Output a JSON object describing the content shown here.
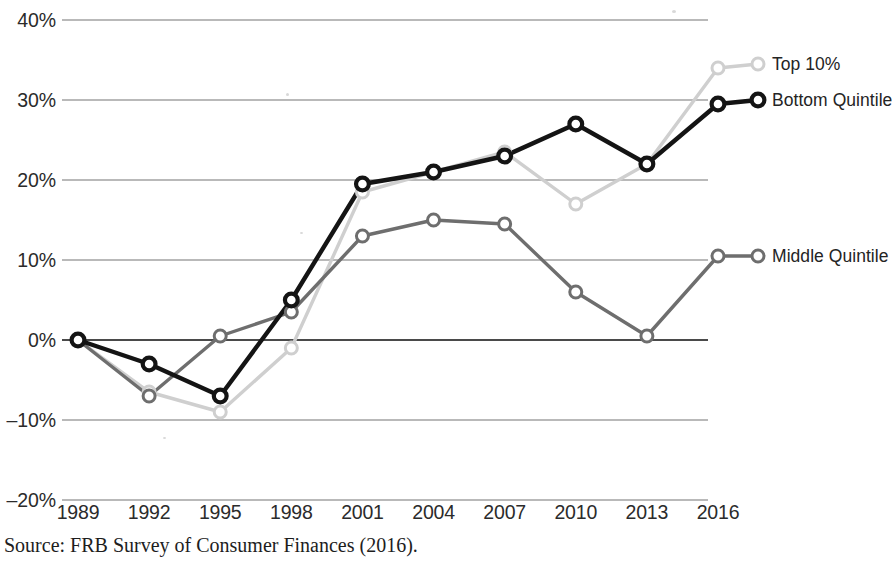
{
  "figure": {
    "title_remnant": "",
    "source_note": "Source: FRB Survey of Consumer Finances (2016)."
  },
  "axis": {
    "y_ticks": [
      "40%",
      "30%",
      "20%",
      "10%",
      "0%",
      "–10%",
      "–20%"
    ],
    "x_ticks": [
      "1989",
      "1992",
      "1995",
      "1998",
      "2001",
      "2004",
      "2007",
      "2010",
      "2013",
      "2016"
    ]
  },
  "series_labels": {
    "top10": "Top 10%",
    "bottom": "Bottom Quintile",
    "middle": "Middle Quintile"
  },
  "colors": {
    "top10": "#cfcfcf",
    "bottom": "#141414",
    "middle": "#6e6e6e",
    "gridline": "#b9b9b9",
    "zeroline": "#4a4a4a",
    "text": "#2b2b2b"
  },
  "chart_data": {
    "type": "line",
    "title": "",
    "xlabel": "",
    "ylabel": "",
    "ylim": [
      -20,
      40
    ],
    "ytick_values": [
      40,
      30,
      20,
      10,
      0,
      -10,
      -20
    ],
    "grid": true,
    "legend": "inline-end-labels",
    "x": [
      1989,
      1992,
      1995,
      1998,
      2001,
      2004,
      2007,
      2010,
      2013,
      2016
    ],
    "categories": [
      "1989",
      "1992",
      "1995",
      "1998",
      "2001",
      "2004",
      "2007",
      "2010",
      "2013",
      "2016"
    ],
    "series": [
      {
        "name": "Top 10%",
        "color": "#cfcfcf",
        "values": [
          0,
          -6.5,
          -9,
          -1,
          18.5,
          21,
          23.5,
          17,
          22,
          34
        ]
      },
      {
        "name": "Bottom Quintile",
        "color": "#141414",
        "values": [
          0,
          -3,
          -7,
          5,
          19.5,
          21,
          23,
          27,
          22,
          29.5
        ]
      },
      {
        "name": "Middle Quintile",
        "color": "#6e6e6e",
        "values": [
          0,
          -7,
          0.5,
          3.5,
          13,
          15,
          14.5,
          6,
          0.5,
          10.5
        ]
      }
    ],
    "annotations": [
      {
        "text": "Source: FRB Survey of Consumer Finances (2016).",
        "position": "below-axis"
      }
    ]
  }
}
